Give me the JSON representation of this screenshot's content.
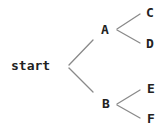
{
  "diagram": {
    "type": "tree",
    "nodes": {
      "root": "start",
      "a": "A",
      "b": "B",
      "c": "C",
      "d": "D",
      "e": "E",
      "f": "F"
    },
    "edges": [
      [
        "start",
        "A"
      ],
      [
        "start",
        "B"
      ],
      [
        "A",
        "C"
      ],
      [
        "A",
        "D"
      ],
      [
        "B",
        "E"
      ],
      [
        "B",
        "F"
      ]
    ],
    "line_color": "#8a8a8a",
    "text_color": "#222222"
  }
}
